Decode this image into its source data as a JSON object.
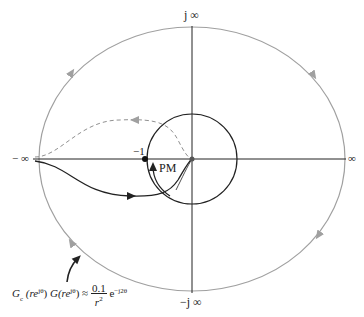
{
  "diagram": {
    "type": "nyquist-contour",
    "axis_labels": {
      "pos_imag": "j ∞",
      "neg_imag": "−j ∞",
      "pos_real": "∞",
      "neg_real": "− ∞"
    },
    "point_label": "−1",
    "phase_margin_label": "PM",
    "formula": {
      "lhs": "G",
      "lhs_sub": "c",
      "arg1": "(re",
      "exp": "jθ",
      "close": ")",
      "g": "G",
      "approx": "≈",
      "num": "0.1",
      "den": "r",
      "den_exp": "2",
      "e": "e",
      "e_exp": "−j2θ"
    },
    "colors": {
      "contour": "#a0a0a0",
      "axes": "#222222",
      "curve": "#222222",
      "dashed": "#909090",
      "unit_circle": "#222222"
    }
  }
}
